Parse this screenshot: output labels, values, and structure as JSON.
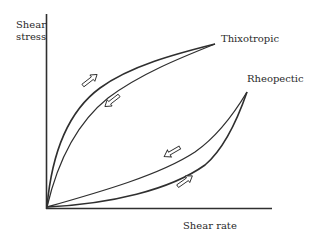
{
  "diagram": {
    "title": "",
    "y_axis": {
      "label_line1": "Shear",
      "label_line2": "stress"
    },
    "x_axis": {
      "label": "Shear rate"
    },
    "curves": [
      {
        "name": "Thixotropic",
        "label": "Thixotropic",
        "description": "Hysteresis loop: upward curve (upper branch) and downward curve (lower branch) converging at upper right",
        "arrows": [
          "up-right on upper branch",
          "down-left on lower branch"
        ]
      },
      {
        "name": "Rheopectic",
        "label": "Rheopectic",
        "description": "Hysteresis loop: concave-up curves diverging from origin and converging at upper right",
        "arrows": [
          "down-left on upper branch",
          "up-right on lower branch"
        ]
      }
    ],
    "colors": {
      "line": "#2f2f2f",
      "text": "#2a2a2a",
      "background": "#ffffff"
    }
  }
}
